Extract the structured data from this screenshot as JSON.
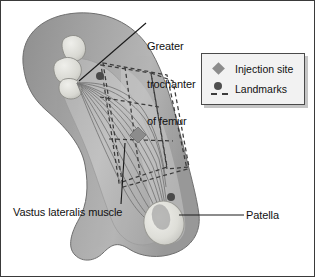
{
  "figure": {
    "type": "anatomical-illustration",
    "background_color": "#ffffff",
    "border_color": "#3a3a3a"
  },
  "annotations": {
    "greater_trochanter": {
      "text": "Greater\ntrochanter\nof femur",
      "line1": "Greater",
      "line2": "trochanter",
      "line3": "of femur"
    },
    "vastus_lateralis": {
      "text": "Vastus lateralis muscle"
    },
    "patella": {
      "text": "Patella"
    }
  },
  "legend": {
    "items": [
      {
        "marker": "diamond-marker",
        "label": "Injection site",
        "color": "#8c8c8c"
      },
      {
        "marker": "dot-and-dash-marker",
        "label": "Landmarks",
        "color": "#4f4f4f"
      }
    ],
    "box_fill": "#f2f2f2",
    "box_border": "#4a4a4a"
  },
  "colors": {
    "skin_mid": "#9a9a9a",
    "skin_light": "#b4b4b4",
    "skin_dark": "#8a8a8a",
    "muscle_light": "#c4c4c4",
    "bone_light": "#e6e6e3",
    "fiber": "#6a6a6a",
    "landmark_dash": "#3c3c3c",
    "leader_line": "#1a1a1a"
  }
}
